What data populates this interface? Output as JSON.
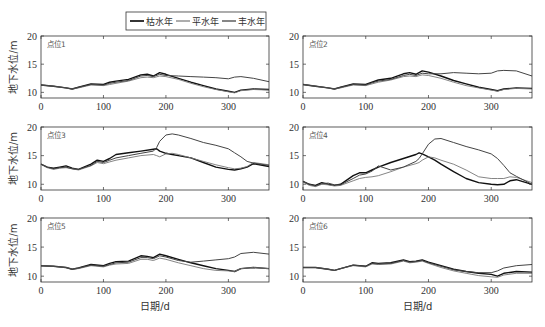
{
  "legend": {
    "items": [
      {
        "label": "枯水年",
        "color": "#111111",
        "width": 1.4
      },
      {
        "label": "平水年",
        "color": "#777777",
        "width": 0.9
      },
      {
        "label": "丰水年",
        "color": "#444444",
        "width": 1.0
      }
    ]
  },
  "axes": {
    "ylabel": "地下水位/m",
    "xlabel": "日期/d",
    "xticks": [
      0,
      100,
      200,
      300
    ],
    "yticks": [
      10,
      15,
      20
    ],
    "xlim": [
      0,
      365
    ],
    "ylim": [
      9,
      20
    ]
  },
  "chart_data": [
    {
      "type": "line",
      "title": "点位1",
      "xlabel": "",
      "ylabel": "地下水位/m",
      "xlim": [
        0,
        365
      ],
      "ylim": [
        9,
        20
      ],
      "x": [
        0,
        20,
        40,
        50,
        60,
        80,
        100,
        110,
        120,
        140,
        160,
        170,
        180,
        190,
        200,
        220,
        240,
        260,
        280,
        300,
        310,
        320,
        340,
        365
      ],
      "series": [
        {
          "name": "枯水年",
          "values": [
            11.3,
            11.1,
            10.8,
            10.6,
            10.9,
            11.5,
            11.4,
            11.8,
            12.0,
            12.3,
            13.1,
            13.2,
            12.9,
            13.5,
            13.2,
            12.5,
            11.8,
            11.2,
            10.6,
            10.2,
            10.0,
            10.4,
            10.6,
            10.5
          ]
        },
        {
          "name": "平水年",
          "values": [
            11.3,
            11.1,
            10.8,
            10.6,
            10.8,
            11.3,
            11.2,
            11.4,
            11.6,
            12.0,
            12.6,
            12.7,
            12.6,
            12.9,
            12.8,
            12.3,
            11.6,
            11.0,
            10.5,
            10.1,
            9.9,
            10.3,
            10.5,
            10.4
          ]
        },
        {
          "name": "丰水年",
          "values": [
            11.3,
            11.1,
            10.8,
            10.6,
            10.9,
            11.4,
            11.3,
            11.6,
            11.8,
            12.1,
            12.9,
            13.0,
            12.8,
            13.2,
            13.0,
            12.9,
            12.8,
            12.7,
            12.6,
            12.4,
            12.7,
            12.8,
            12.5,
            11.9
          ]
        }
      ]
    },
    {
      "type": "line",
      "title": "点位2",
      "xlabel": "",
      "ylabel": "",
      "xlim": [
        0,
        365
      ],
      "ylim": [
        9,
        20
      ],
      "x": [
        0,
        20,
        40,
        50,
        60,
        80,
        100,
        110,
        120,
        140,
        160,
        170,
        180,
        190,
        200,
        220,
        240,
        260,
        280,
        300,
        310,
        320,
        340,
        365
      ],
      "series": [
        {
          "name": "枯水年",
          "values": [
            11.4,
            11.1,
            10.8,
            10.6,
            10.9,
            11.5,
            11.4,
            11.8,
            12.2,
            12.5,
            13.3,
            13.5,
            13.2,
            13.8,
            13.6,
            12.9,
            12.1,
            11.5,
            10.9,
            10.5,
            10.3,
            10.6,
            10.8,
            10.7
          ]
        },
        {
          "name": "平水年",
          "values": [
            11.4,
            11.1,
            10.8,
            10.6,
            10.8,
            11.3,
            11.2,
            11.5,
            11.8,
            12.2,
            12.8,
            12.9,
            12.8,
            13.1,
            13.0,
            12.5,
            11.8,
            11.2,
            10.8,
            10.4,
            10.2,
            10.5,
            10.7,
            10.6
          ]
        },
        {
          "name": "丰水年",
          "values": [
            11.4,
            11.1,
            10.8,
            10.6,
            10.9,
            11.4,
            11.3,
            11.7,
            12.0,
            12.3,
            13.0,
            13.2,
            13.0,
            13.4,
            13.3,
            13.3,
            13.5,
            13.4,
            13.3,
            13.4,
            13.8,
            13.9,
            13.8,
            12.9
          ]
        }
      ]
    },
    {
      "type": "line",
      "title": "点位3",
      "xlabel": "",
      "ylabel": "地下水位/m",
      "xlim": [
        0,
        365
      ],
      "ylim": [
        9,
        20
      ],
      "x": [
        0,
        10,
        20,
        30,
        40,
        50,
        60,
        80,
        90,
        100,
        110,
        120,
        140,
        160,
        180,
        185,
        190,
        200,
        210,
        220,
        240,
        260,
        280,
        300,
        310,
        320,
        330,
        340,
        365
      ],
      "series": [
        {
          "name": "枯水年",
          "values": [
            13.5,
            13.0,
            12.8,
            13.0,
            13.2,
            12.8,
            12.6,
            13.5,
            14.2,
            14.0,
            14.5,
            15.2,
            15.5,
            15.8,
            16.1,
            16.2,
            15.8,
            15.4,
            15.2,
            15.0,
            14.6,
            13.8,
            13.0,
            12.6,
            12.5,
            12.7,
            13.0,
            13.6,
            13.1
          ]
        },
        {
          "name": "平水年",
          "values": [
            13.5,
            12.9,
            12.6,
            12.8,
            12.9,
            12.7,
            12.5,
            13.2,
            13.8,
            13.6,
            13.9,
            14.2,
            14.6,
            15.0,
            15.2,
            15.0,
            14.8,
            15.3,
            15.4,
            15.2,
            14.6,
            14.0,
            13.4,
            12.9,
            12.7,
            12.8,
            13.1,
            13.8,
            13.4
          ]
        },
        {
          "name": "丰水年",
          "values": [
            13.5,
            13.0,
            12.7,
            12.9,
            13.0,
            12.7,
            12.6,
            13.3,
            14.0,
            13.8,
            14.2,
            14.6,
            15.0,
            15.4,
            15.8,
            16.4,
            17.5,
            18.6,
            18.8,
            18.6,
            18.0,
            17.3,
            16.8,
            16.2,
            15.5,
            14.8,
            14.0,
            13.7,
            13.3
          ]
        }
      ]
    },
    {
      "type": "line",
      "title": "点位4",
      "xlabel": "",
      "ylabel": "",
      "xlim": [
        0,
        365
      ],
      "ylim": [
        9,
        20
      ],
      "x": [
        0,
        10,
        20,
        30,
        40,
        50,
        60,
        80,
        90,
        100,
        110,
        120,
        140,
        160,
        180,
        185,
        190,
        200,
        210,
        220,
        240,
        260,
        280,
        300,
        310,
        320,
        330,
        340,
        365
      ],
      "series": [
        {
          "name": "枯水年",
          "values": [
            10.5,
            10.0,
            9.8,
            10.3,
            10.0,
            9.8,
            10.0,
            11.5,
            12.0,
            12.0,
            12.5,
            13.0,
            13.8,
            14.5,
            15.2,
            15.5,
            15.3,
            14.8,
            14.2,
            13.5,
            12.2,
            11.0,
            10.3,
            10.0,
            9.9,
            10.0,
            10.6,
            10.8,
            10.0
          ]
        },
        {
          "name": "平水年",
          "values": [
            10.4,
            9.8,
            9.6,
            10.0,
            9.9,
            9.7,
            9.8,
            10.6,
            11.0,
            11.2,
            11.3,
            11.5,
            12.2,
            13.0,
            13.6,
            13.8,
            14.2,
            14.8,
            14.6,
            14.2,
            13.5,
            12.5,
            11.3,
            11.0,
            11.0,
            11.0,
            11.3,
            11.2,
            10.3
          ]
        },
        {
          "name": "丰水年",
          "values": [
            10.5,
            10.0,
            9.7,
            10.1,
            10.2,
            9.9,
            9.9,
            11.0,
            11.6,
            11.8,
            12.3,
            13.2,
            12.5,
            13.0,
            14.0,
            14.5,
            15.3,
            17.0,
            17.9,
            18.0,
            17.3,
            16.6,
            16.0,
            15.3,
            14.5,
            13.3,
            12.0,
            11.4,
            10.0
          ]
        }
      ]
    },
    {
      "type": "line",
      "title": "点位5",
      "xlabel": "日期/d",
      "ylabel": "地下水位/m",
      "xlim": [
        0,
        365
      ],
      "ylim": [
        9,
        20
      ],
      "x": [
        0,
        20,
        40,
        50,
        60,
        80,
        100,
        110,
        120,
        140,
        160,
        170,
        180,
        190,
        200,
        220,
        240,
        260,
        280,
        300,
        310,
        320,
        340,
        365
      ],
      "series": [
        {
          "name": "枯水年",
          "values": [
            11.8,
            11.7,
            11.5,
            11.2,
            11.4,
            12.0,
            11.8,
            12.2,
            12.5,
            12.6,
            13.5,
            13.4,
            13.2,
            13.8,
            13.5,
            12.9,
            12.3,
            11.8,
            11.3,
            11.0,
            10.8,
            11.3,
            11.5,
            11.3
          ]
        },
        {
          "name": "平水年",
          "values": [
            11.8,
            11.7,
            11.5,
            11.2,
            11.3,
            11.8,
            11.6,
            11.9,
            12.1,
            12.2,
            12.9,
            12.9,
            12.7,
            13.1,
            12.9,
            12.3,
            11.8,
            11.3,
            11.0,
            10.9,
            10.8,
            11.3,
            11.5,
            11.3
          ]
        },
        {
          "name": "丰水年",
          "values": [
            11.8,
            11.7,
            11.5,
            11.2,
            11.4,
            11.9,
            11.7,
            12.0,
            12.3,
            12.4,
            13.2,
            13.2,
            13.0,
            13.5,
            13.3,
            12.7,
            12.4,
            12.6,
            12.8,
            13.0,
            13.3,
            13.9,
            14.1,
            13.8
          ]
        }
      ]
    },
    {
      "type": "line",
      "title": "点位6",
      "xlabel": "日期/d",
      "ylabel": "",
      "xlim": [
        0,
        365
      ],
      "ylim": [
        9,
        20
      ],
      "x": [
        0,
        20,
        40,
        50,
        60,
        80,
        100,
        110,
        120,
        140,
        160,
        170,
        180,
        190,
        200,
        220,
        240,
        260,
        280,
        300,
        310,
        320,
        340,
        365
      ],
      "series": [
        {
          "name": "枯水年",
          "values": [
            11.5,
            11.5,
            11.2,
            11.0,
            11.3,
            11.9,
            11.7,
            12.3,
            12.2,
            12.3,
            12.8,
            12.5,
            12.6,
            12.8,
            12.4,
            11.8,
            11.2,
            10.8,
            10.5,
            10.3,
            10.0,
            10.5,
            10.8,
            10.7
          ]
        },
        {
          "name": "平水年",
          "values": [
            11.5,
            11.5,
            11.2,
            11.0,
            11.3,
            11.8,
            11.6,
            12.1,
            12.0,
            12.1,
            12.6,
            12.3,
            12.4,
            12.6,
            12.2,
            11.5,
            10.9,
            10.5,
            10.1,
            9.9,
            9.8,
            10.2,
            10.5,
            10.5
          ]
        },
        {
          "name": "丰水年",
          "values": [
            11.5,
            11.5,
            11.2,
            11.0,
            11.3,
            11.9,
            11.7,
            12.2,
            12.1,
            12.2,
            12.7,
            12.4,
            12.5,
            12.7,
            12.3,
            11.7,
            11.1,
            10.8,
            10.6,
            10.6,
            10.9,
            11.4,
            11.8,
            12.0
          ]
        }
      ]
    }
  ]
}
